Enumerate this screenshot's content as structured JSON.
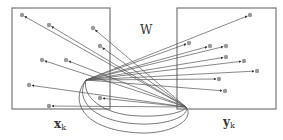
{
  "diagram": {
    "label_w": "W",
    "label_x": "x",
    "label_x_sub": "k",
    "label_y": "y",
    "label_y_sub": "k",
    "colors": {
      "stroke": "#555555",
      "dot": "#999999",
      "box": "#777777"
    },
    "left_box": {
      "x": 12,
      "y": 8,
      "w": 98,
      "h": 101
    },
    "right_box": {
      "x": 177,
      "y": 8,
      "w": 99,
      "h": 101
    },
    "left_hub": [
      86,
      80
    ],
    "right_hub": [
      186,
      107
    ],
    "left_points": [
      [
        22,
        15
      ],
      [
        49,
        25
      ],
      [
        93,
        28
      ],
      [
        100,
        46
      ],
      [
        42,
        60
      ],
      [
        66,
        60
      ],
      [
        29,
        85
      ],
      [
        100,
        98
      ],
      [
        49,
        106
      ]
    ],
    "right_points": [
      [
        250,
        15
      ],
      [
        189,
        43
      ],
      [
        210,
        46
      ],
      [
        226,
        46
      ],
      [
        226,
        57
      ],
      [
        244,
        61
      ],
      [
        257,
        71
      ],
      [
        219,
        79
      ],
      [
        225,
        91
      ]
    ]
  }
}
